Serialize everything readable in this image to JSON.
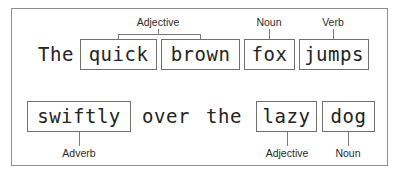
{
  "figure": {
    "sentence": "The quick brown fox jumps swiftly over the lazy dog",
    "frame_color": "#8d8d8d",
    "box_color": "#6f6f6f",
    "connector_color": "#7a7a7a",
    "text_color": "#232323",
    "background": "#ffffff"
  },
  "rows": [
    {
      "id": "row-1",
      "tokens": [
        {
          "text": "The",
          "boxed": false
        },
        {
          "text": "quick",
          "boxed": true
        },
        {
          "text": "brown",
          "boxed": true
        },
        {
          "text": "fox",
          "boxed": true
        },
        {
          "text": "jumps",
          "boxed": true
        }
      ]
    },
    {
      "id": "row-2",
      "tokens": [
        {
          "text": "swiftly",
          "boxed": true
        },
        {
          "text": "over",
          "boxed": false
        },
        {
          "text": "the",
          "boxed": false
        },
        {
          "text": "lazy",
          "boxed": true
        },
        {
          "text": "dog",
          "boxed": true
        }
      ]
    }
  ],
  "annotations": {
    "top": [
      {
        "label": "Adjective",
        "targets": "quick brown",
        "bracket": true
      },
      {
        "label": "Noun",
        "targets": "fox",
        "bracket": false
      },
      {
        "label": "Verb",
        "targets": "jumps",
        "bracket": false
      }
    ],
    "bottom": [
      {
        "label": "Adverb",
        "targets": "swiftly",
        "bracket": false
      },
      {
        "label": "Adjective",
        "targets": "lazy",
        "bracket": false
      },
      {
        "label": "Noun",
        "targets": "dog",
        "bracket": false
      }
    ]
  }
}
